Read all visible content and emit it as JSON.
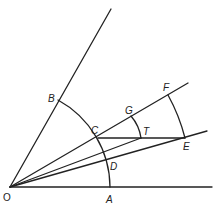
{
  "diagram": {
    "type": "geometric-construction",
    "colors": {
      "stroke": "#222222",
      "background": "#ffffff"
    },
    "labels": {
      "O": "O",
      "A": "A",
      "B": "B",
      "C": "C",
      "D": "D",
      "E": "E",
      "F": "F",
      "G": "G",
      "T": "T"
    },
    "points": {
      "O": [
        10,
        187
      ],
      "A": [
        110,
        187
      ],
      "B": [
        58,
        102
      ],
      "C": [
        98,
        138
      ],
      "D": [
        107,
        160
      ],
      "E": [
        185,
        138
      ],
      "F": [
        168,
        96
      ],
      "G": [
        131,
        117
      ],
      "T": [
        141,
        138
      ]
    },
    "segments": [
      "O-A extended",
      "O-B extended",
      "O-F through C and G",
      "O-E through D",
      "O-T",
      "C-E"
    ],
    "arcs": [
      {
        "name": "arc-BCDA",
        "center": "O",
        "from": "B",
        "to": "A"
      },
      {
        "name": "arc-FE",
        "center": "O",
        "from": "F",
        "to": "E"
      },
      {
        "name": "arc-GT",
        "center": "C",
        "from": "G",
        "to": "T"
      }
    ]
  }
}
